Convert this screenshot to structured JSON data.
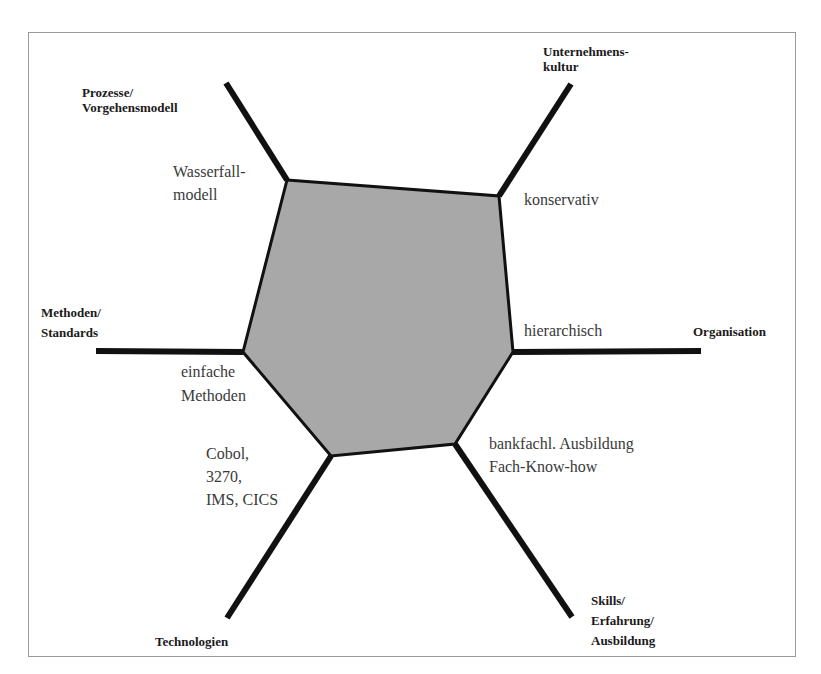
{
  "diagram": {
    "type": "hexagonal-profile (spider) diagram",
    "fill_color": "#a8a8a8",
    "axis_color": "#111111",
    "axes": [
      {
        "id": "prozesse",
        "label": "Prozesse/\nVorgehensmodell",
        "value": "Wasserfall-\nmodell"
      },
      {
        "id": "kultur",
        "label": "Unternehmens-\nkultur",
        "value": "konservativ"
      },
      {
        "id": "organisation",
        "label": "Organisation",
        "value": "hierarchisch"
      },
      {
        "id": "skills",
        "label": "Skills/\nErfahrung/\nAusbildung",
        "value": "bankfachl. Ausbildung\nFach-Know-how"
      },
      {
        "id": "technologien",
        "label": "Technologien",
        "value": "Cobol,\n3270,\nIMS, CICS"
      },
      {
        "id": "methoden",
        "label": "Methoden/\nStandards",
        "value": "einfache\nMethoden"
      }
    ]
  }
}
